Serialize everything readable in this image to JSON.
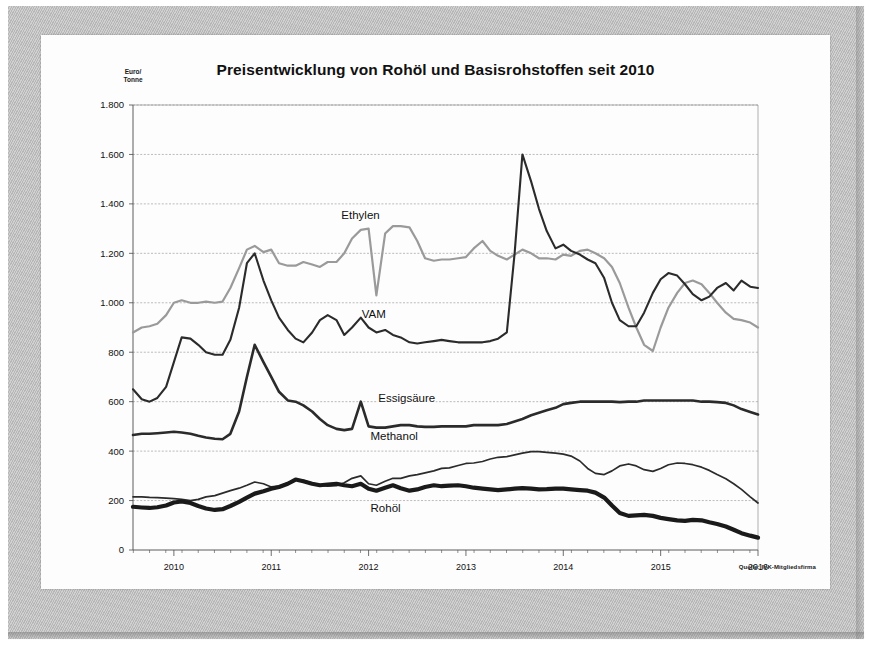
{
  "document": {
    "kind": "scanned-chart-page",
    "mat_color": "#bdbdbd",
    "page_color": "#fdfdfd"
  },
  "chart_data": {
    "type": "line",
    "title": "Preisentwicklung von Rohöl und Basisrohstoffen seit 2010",
    "xlabel": "",
    "ylabel": "Euro/ Tonne",
    "ylabel_lines": [
      "Euro/",
      "Tonne"
    ],
    "source_note": "Quelle: IVK-Mitgliedsfirma",
    "grid": true,
    "legend_position": "inline-labels",
    "ylim": [
      0,
      1800
    ],
    "ytick_labels": [
      "0",
      "200",
      "400",
      "600",
      "800",
      "1.000",
      "1.200",
      "1.400",
      "1.600",
      "1.800"
    ],
    "ytick_values": [
      0,
      200,
      400,
      600,
      800,
      1000,
      1200,
      1400,
      1600,
      1800
    ],
    "xlim": [
      2009.58,
      2016.0
    ],
    "xtick_labels": [
      "2010",
      "2011",
      "2012",
      "2013",
      "2014",
      "2015",
      "2016"
    ],
    "xtick_values": [
      2010,
      2011,
      2012,
      2013,
      2014,
      2015,
      2016
    ],
    "minor_tick_months": true,
    "x": [
      2009.58,
      2009.67,
      2009.75,
      2009.83,
      2009.92,
      2010.0,
      2010.08,
      2010.17,
      2010.25,
      2010.33,
      2010.42,
      2010.5,
      2010.58,
      2010.67,
      2010.75,
      2010.83,
      2010.92,
      2011.0,
      2011.08,
      2011.17,
      2011.25,
      2011.33,
      2011.42,
      2011.5,
      2011.58,
      2011.67,
      2011.75,
      2011.83,
      2011.92,
      2012.0,
      2012.08,
      2012.17,
      2012.25,
      2012.33,
      2012.42,
      2012.5,
      2012.58,
      2012.67,
      2012.75,
      2012.83,
      2012.92,
      2013.0,
      2013.08,
      2013.17,
      2013.25,
      2013.33,
      2013.42,
      2013.5,
      2013.58,
      2013.67,
      2013.75,
      2013.83,
      2013.92,
      2014.0,
      2014.08,
      2014.17,
      2014.25,
      2014.33,
      2014.42,
      2014.5,
      2014.58,
      2014.67,
      2014.75,
      2014.83,
      2014.92,
      2015.0,
      2015.08,
      2015.17,
      2015.25,
      2015.33,
      2015.42,
      2015.5,
      2015.58,
      2015.67,
      2015.75,
      2015.83,
      2015.92,
      2016.0
    ],
    "series": [
      {
        "name": "Ethylen",
        "color": "#9a9a9a",
        "width": 2.2,
        "label_x": 2011.72,
        "label_y": 1340,
        "values": [
          880,
          900,
          905,
          915,
          950,
          1000,
          1010,
          1000,
          1000,
          1005,
          1000,
          1005,
          1060,
          1140,
          1215,
          1230,
          1205,
          1215,
          1160,
          1150,
          1150,
          1165,
          1155,
          1145,
          1165,
          1165,
          1200,
          1260,
          1295,
          1300,
          1030,
          1280,
          1310,
          1310,
          1305,
          1250,
          1180,
          1170,
          1175,
          1175,
          1180,
          1185,
          1220,
          1250,
          1210,
          1190,
          1175,
          1195,
          1215,
          1200,
          1180,
          1180,
          1175,
          1195,
          1190,
          1210,
          1215,
          1200,
          1180,
          1145,
          1080,
          980,
          900,
          830,
          805,
          900,
          980,
          1040,
          1080,
          1090,
          1075,
          1040,
          1000,
          960,
          935,
          930,
          920,
          900
        ]
      },
      {
        "name": "VAM",
        "color": "#2b2b2b",
        "width": 2.1,
        "label_x": 2011.93,
        "label_y": 940,
        "values": [
          650,
          610,
          600,
          615,
          660,
          760,
          860,
          855,
          830,
          800,
          790,
          790,
          850,
          980,
          1160,
          1200,
          1090,
          1010,
          940,
          890,
          855,
          840,
          880,
          930,
          950,
          930,
          870,
          900,
          940,
          900,
          880,
          890,
          870,
          860,
          840,
          835,
          840,
          845,
          850,
          845,
          840,
          840,
          840,
          840,
          845,
          855,
          880,
          1200,
          1600,
          1490,
          1380,
          1290,
          1220,
          1235,
          1210,
          1195,
          1175,
          1160,
          1100,
          1000,
          930,
          905,
          905,
          960,
          1040,
          1095,
          1120,
          1110,
          1075,
          1035,
          1010,
          1025,
          1060,
          1080,
          1050,
          1090,
          1065,
          1060
        ]
      },
      {
        "name": "Essigsäure",
        "color": "#2b2b2b",
        "width": 2.6,
        "label_x": 2012.1,
        "label_y": 600,
        "values": [
          465,
          470,
          470,
          472,
          475,
          478,
          475,
          470,
          462,
          455,
          450,
          448,
          470,
          560,
          700,
          830,
          760,
          700,
          640,
          605,
          600,
          585,
          560,
          530,
          505,
          490,
          485,
          490,
          600,
          500,
          495,
          495,
          500,
          505,
          505,
          500,
          498,
          498,
          500,
          500,
          500,
          500,
          505,
          505,
          505,
          505,
          510,
          520,
          530,
          545,
          555,
          565,
          575,
          590,
          595,
          600,
          600,
          600,
          600,
          600,
          598,
          600,
          600,
          605,
          605,
          605,
          605,
          605,
          605,
          605,
          600,
          600,
          598,
          595,
          585,
          570,
          558,
          548
        ]
      },
      {
        "name": "Methanol",
        "color": "#2b2b2b",
        "width": 1.7,
        "label_x": 2012.02,
        "label_y": 445,
        "values": [
          215,
          215,
          213,
          212,
          210,
          208,
          205,
          200,
          205,
          215,
          220,
          230,
          240,
          250,
          262,
          275,
          268,
          255,
          258,
          272,
          285,
          282,
          270,
          262,
          258,
          260,
          272,
          290,
          300,
          268,
          262,
          278,
          290,
          290,
          300,
          305,
          312,
          320,
          330,
          332,
          342,
          350,
          352,
          358,
          368,
          375,
          378,
          385,
          392,
          398,
          398,
          395,
          392,
          388,
          380,
          360,
          330,
          310,
          305,
          320,
          340,
          348,
          340,
          325,
          318,
          330,
          345,
          352,
          350,
          345,
          335,
          322,
          305,
          288,
          268,
          245,
          215,
          190
        ]
      },
      {
        "name": "Rohöl",
        "color": "#1a1a1a",
        "width": 4.2,
        "label_x": 2012.02,
        "label_y": 155,
        "values": [
          175,
          172,
          170,
          173,
          180,
          192,
          196,
          190,
          178,
          168,
          162,
          165,
          178,
          195,
          212,
          228,
          238,
          248,
          255,
          268,
          285,
          278,
          268,
          262,
          265,
          268,
          262,
          258,
          268,
          248,
          240,
          252,
          262,
          250,
          240,
          245,
          255,
          262,
          258,
          260,
          262,
          258,
          252,
          248,
          245,
          242,
          245,
          248,
          250,
          248,
          245,
          246,
          248,
          248,
          245,
          242,
          240,
          232,
          212,
          180,
          150,
          138,
          140,
          142,
          138,
          130,
          125,
          120,
          118,
          122,
          120,
          112,
          105,
          95,
          82,
          68,
          58,
          50
        ]
      }
    ]
  }
}
